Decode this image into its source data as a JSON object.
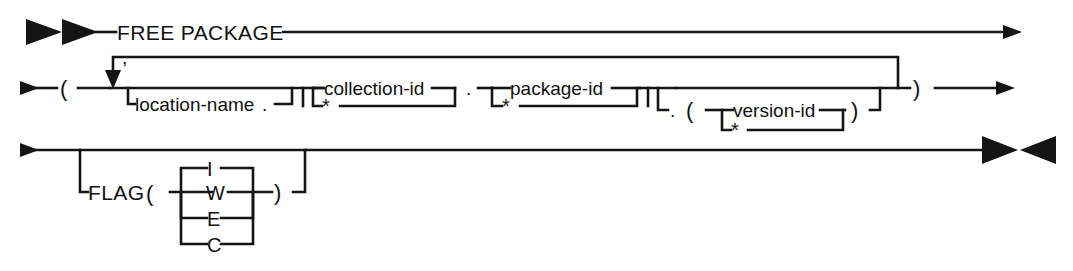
{
  "diagram": {
    "title": "FREE PACKAGE",
    "type": "railroad-syntax-diagram",
    "ink_color": "#151515",
    "background_color": "#ffffff",
    "lines": [
      {
        "id": "line-1",
        "start_marker": "double-right-triangle",
        "end_marker": "arrowhead-right",
        "tokens": [
          "FREE PACKAGE"
        ]
      },
      {
        "id": "line-2",
        "start_marker": "arrowhead-right",
        "end_marker": "arrowhead-right",
        "tokens": [
          "(",
          "location-name",
          ".",
          "collection-id",
          "*",
          ".",
          "package-id",
          "*",
          ".",
          "(",
          "version-id",
          "*",
          ")",
          ")"
        ],
        "loop_label": ","
      },
      {
        "id": "line-3",
        "start_marker": "arrowhead-right",
        "end_marker": "right-left-triangle-pair",
        "tokens": [
          "FLAG",
          "(",
          "I",
          "W",
          "E",
          "C",
          ")"
        ]
      }
    ],
    "labels": {
      "keyword_free_package": "FREE PACKAGE",
      "open_paren_1": "(",
      "close_paren_1": ")",
      "comma": ",",
      "location_name": "location-name",
      "dot_after_location": ".",
      "collection_id": "collection-id",
      "collection_star": "*",
      "dot_1": ".",
      "package_id": "package-id",
      "package_star": "*",
      "dot_2": ".",
      "open_paren_2": "(",
      "version_id": "version-id",
      "version_star": "*",
      "close_paren_2": ")",
      "flag_keyword": "FLAG",
      "flag_open_paren": "(",
      "flag_close_paren": ")",
      "flag_option_i": "I",
      "flag_option_w": "W",
      "flag_option_e": "E",
      "flag_option_c": "C"
    }
  }
}
